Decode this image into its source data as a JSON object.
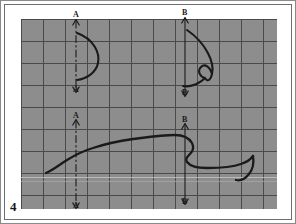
{
  "figure": {
    "number": "4",
    "kind": "engineering-sketch",
    "media": "graph-paper",
    "paper_color": "#8d8d8d",
    "grid_color": "#4a4a4a",
    "ink_color": "#1a1a1a"
  },
  "grid": {
    "origin_x": 20,
    "origin_y": 18,
    "width": 256,
    "height": 190,
    "cell_size": 22,
    "columns": 12,
    "rows": 9
  },
  "section_lines": [
    {
      "id": "A-A",
      "label": "A",
      "style": "dash-dot-centerline",
      "x": 75,
      "top_label_y": 14,
      "bottom_label_y": 88,
      "view": "upper-left"
    },
    {
      "id": "A-A-lower",
      "label": "A",
      "style": "dash-dot-centerline",
      "x": 75,
      "top_label_y": 114,
      "bottom_label_y": 204,
      "view": "lower-left"
    },
    {
      "id": "B-B",
      "label": "B",
      "style": "solid-centerline",
      "x": 184,
      "top_label_y": 12,
      "bottom_label_y": 92,
      "view": "upper-right"
    },
    {
      "id": "B-B-lower",
      "label": "B",
      "style": "solid-centerline",
      "x": 184,
      "top_label_y": 118,
      "bottom_label_y": 200,
      "view": "lower-right"
    }
  ],
  "labels": [
    {
      "text": "A",
      "x": 72,
      "y": 10
    },
    {
      "text": "A",
      "x": 72,
      "y": 85
    },
    {
      "text": "B",
      "x": 181,
      "y": 8
    },
    {
      "text": "B",
      "x": 181,
      "y": 88
    },
    {
      "text": "A",
      "x": 72,
      "y": 111
    },
    {
      "text": "A",
      "x": 72,
      "y": 201
    },
    {
      "text": "B",
      "x": 181,
      "y": 115
    },
    {
      "text": "B",
      "x": 181,
      "y": 197
    }
  ],
  "curves": {
    "section_a_profile": "M 76,32 C 93,38 99,52 97,62 C 95,72 85,78 76,79",
    "section_b_profile": "M 186,29 C 205,42 214,62 211,73 C 209,66 204,62 200,66 C 196,70 199,76 204,77 C 196,85 186,86 182,85",
    "section_b_tail": "M 211,73 C 210,78 207,82 204,77",
    "plan_profile": "M 45,172 C 52,169 58,164 66,159 C 74,154 82,150 92,147 C 104,143 118,140 132,138 C 148,136 162,134 174,134 C 182,134 188,137 191,142 C 193,146 192,150 189,153 C 186,156 184,158 186,161 C 189,165 196,167 206,167 C 220,167 232,166 240,163 C 246,161 250,158 252,155",
    "plan_hook": "M 252,155 C 253,161 252,168 248,173 C 244,178 239,180 235,179"
  },
  "artifacts": {
    "scan_lines": [
      {
        "y": 176,
        "color": "#c9c9c9"
      },
      {
        "y": 180,
        "color": "#a8a8a8"
      }
    ]
  }
}
